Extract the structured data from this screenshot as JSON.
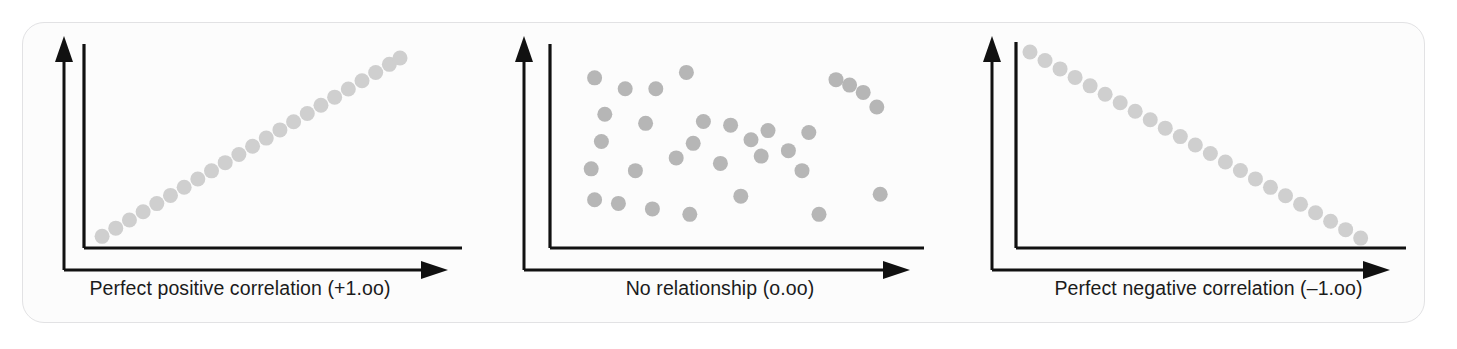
{
  "figure": {
    "background_color": "#ffffff",
    "card_color": "#fcfcfc",
    "card_border_color": "#e2e2e4",
    "axis_color": "#111111",
    "caption_color": "#1b1b1b"
  },
  "chart_data": [
    {
      "type": "scatter",
      "title": "Perfect positive correlation (+1.oo)",
      "xlabel": "",
      "ylabel": "",
      "xlim": [
        0,
        100
      ],
      "ylim": [
        0,
        100
      ],
      "grid": false,
      "legend": "none",
      "correlation": "+1.00",
      "dot_color": "#cfcfcf",
      "dot_radius": 7.5,
      "n_points": 23,
      "x": [
        2,
        6.5,
        11,
        15.5,
        20,
        24.5,
        29,
        33.5,
        38,
        42.5,
        47,
        51.5,
        56,
        60.5,
        65,
        69.5,
        74,
        78.5,
        83,
        87.5,
        92,
        96.5,
        100
      ],
      "y": [
        2,
        6.5,
        11,
        15.5,
        20,
        24.5,
        29,
        33.5,
        38,
        42.5,
        47,
        51.5,
        56,
        60.5,
        65,
        69.5,
        74,
        78.5,
        83,
        87.5,
        92,
        96.5,
        100
      ]
    },
    {
      "type": "scatter",
      "title": "No relationship (o.oo)",
      "xlabel": "",
      "ylabel": "",
      "xlim": [
        0,
        100
      ],
      "ylim": [
        0,
        100
      ],
      "grid": false,
      "legend": "none",
      "correlation": "0.00",
      "dot_color": "#b6b6b6",
      "dot_radius": 7.5,
      "n_points": 31,
      "x": [
        9,
        18,
        27,
        36,
        12,
        24,
        41,
        49,
        60,
        72,
        84,
        92,
        11,
        38,
        55,
        66,
        80,
        88,
        8,
        21,
        33,
        46,
        58,
        70,
        9,
        16,
        26,
        37,
        52,
        75,
        93
      ],
      "y": [
        88,
        82,
        82,
        91,
        68,
        63,
        64,
        62,
        59,
        58,
        84,
        72,
        53,
        52,
        54,
        48,
        87,
        80,
        38,
        37,
        44,
        41,
        45,
        37,
        21,
        19,
        16,
        13,
        23,
        13,
        24
      ]
    },
    {
      "type": "scatter",
      "title": "Perfect negative correlation (–1.oo)",
      "xlabel": "",
      "ylabel": "",
      "xlim": [
        0,
        100
      ],
      "ylim": [
        0,
        100
      ],
      "grid": false,
      "legend": "none",
      "correlation": "-1.00",
      "dot_color": "#cfcfcf",
      "dot_radius": 7.5,
      "n_points": 23,
      "x": [
        0,
        4.5,
        9,
        13.5,
        18,
        22.5,
        27,
        31.5,
        36,
        40.5,
        45,
        49.5,
        54,
        58.5,
        63,
        67.5,
        72,
        76.5,
        81,
        85.5,
        90,
        94.5,
        99
      ],
      "y": [
        100,
        95.5,
        91,
        86.5,
        82,
        77.5,
        73,
        68.5,
        64,
        59.5,
        55,
        50.5,
        46,
        41.5,
        37,
        32.5,
        28,
        23.5,
        19,
        14.5,
        10,
        5.5,
        1
      ]
    }
  ],
  "panels": [
    {
      "id": "perfect-positive",
      "caption": "Perfect positive correlation (+1.oo)"
    },
    {
      "id": "no-relationship",
      "caption": "No relationship (o.oo)"
    },
    {
      "id": "perfect-negative",
      "caption": "Perfect negative correlation (–1.oo)"
    }
  ]
}
